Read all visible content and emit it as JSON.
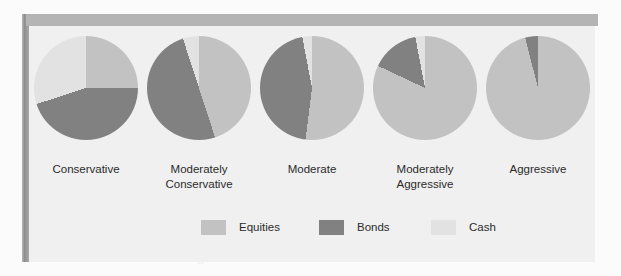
{
  "figure": {
    "background_color": "#f0f0f0",
    "page_color": "#fbfbfb",
    "top_band_color": "#b4b4b4",
    "gutter_color": "#8f8f8f"
  },
  "ghost_text": [
    {
      "text": "assets",
      "x": 300,
      "y": 180
    },
    {
      "text": "allocation",
      "x": 120,
      "y": 214
    },
    {
      "text": "income",
      "x": 512,
      "y": 196
    },
    {
      "text": "portfolio",
      "x": 400,
      "y": 232
    },
    {
      "text": "risk and return over the long term for each model",
      "x": 70,
      "y": 252
    }
  ],
  "legend": {
    "position": "bottom-center",
    "items": [
      {
        "label": "Equities",
        "color": "#c2c2c2",
        "x": 172
      },
      {
        "label": "Bonds",
        "color": "#818181",
        "x": 290
      },
      {
        "label": "Cash",
        "color": "#e2e2e2",
        "x": 402
      }
    ]
  },
  "chart_data": {
    "type": "pie",
    "xlabel": "",
    "ylabel": "",
    "units": "percent",
    "categories": [
      "Equities",
      "Bonds",
      "Cash"
    ],
    "colors": {
      "Equities": "#c2c2c2",
      "Bonds": "#818181",
      "Cash": "#e2e2e2"
    },
    "start_angle_deg": 0,
    "direction": "clockwise",
    "charts": [
      {
        "name": "Conservative",
        "label_line1": "Conservative",
        "label_line2": "",
        "slices": [
          {
            "category": "Equities",
            "value": 25
          },
          {
            "category": "Bonds",
            "value": 45
          },
          {
            "category": "Cash",
            "value": 30
          }
        ]
      },
      {
        "name": "Moderately Conservative",
        "label_line1": "Moderately",
        "label_line2": "Conservative",
        "slices": [
          {
            "category": "Equities",
            "value": 45
          },
          {
            "category": "Bonds",
            "value": 50
          },
          {
            "category": "Cash",
            "value": 5
          }
        ]
      },
      {
        "name": "Moderate",
        "label_line1": "Moderate",
        "label_line2": "",
        "slices": [
          {
            "category": "Equities",
            "value": 52
          },
          {
            "category": "Bonds",
            "value": 45
          },
          {
            "category": "Cash",
            "value": 3
          }
        ]
      },
      {
        "name": "Moderately Aggressive",
        "label_line1": "Moderately",
        "label_line2": "Aggressive",
        "slices": [
          {
            "category": "Equities",
            "value": 82
          },
          {
            "category": "Bonds",
            "value": 15
          },
          {
            "category": "Cash",
            "value": 3
          }
        ]
      },
      {
        "name": "Aggressive",
        "label_line1": "Aggressive",
        "label_line2": "",
        "slices": [
          {
            "category": "Equities",
            "value": 96
          },
          {
            "category": "Bonds",
            "value": 4
          },
          {
            "category": "Cash",
            "value": 0
          }
        ]
      }
    ]
  }
}
